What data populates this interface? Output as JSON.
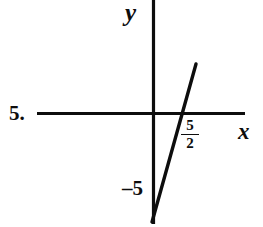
{
  "figure": {
    "problem_number": "5.",
    "background_color": "#ffffff",
    "ink_color": "#0d0d0d",
    "width": 263,
    "height": 227
  },
  "axes": {
    "y_label": "y",
    "x_label": "x",
    "origin": {
      "x": 153,
      "y": 114
    },
    "x_axis": {
      "x1": 37,
      "y1": 113.5,
      "x2": 245,
      "y2": 113.5
    },
    "y_axis": {
      "x1": 153.5,
      "y1": 0,
      "x2": 153.5,
      "y2": 224
    }
  },
  "labels": {
    "x_intercept_numerator": "5",
    "x_intercept_denominator": "2",
    "y_intercept": "–5"
  },
  "chart_data": {
    "type": "line",
    "title": "",
    "xlabel": "x",
    "ylabel": "y",
    "grid": false,
    "legend": null,
    "annotations": [
      {
        "text": "5/2",
        "role": "x-intercept",
        "value": 2.5
      },
      {
        "text": "-5",
        "role": "y-intercept",
        "value": -5
      }
    ],
    "series": [
      {
        "name": "line",
        "equation": "y = 2x - 5",
        "slope": 2,
        "intercept": -5,
        "x_intercept": 2.5,
        "y_intercept": -5,
        "points_pixels": [
          [
            196,
            64
          ],
          [
            152,
            222
          ]
        ]
      }
    ]
  }
}
